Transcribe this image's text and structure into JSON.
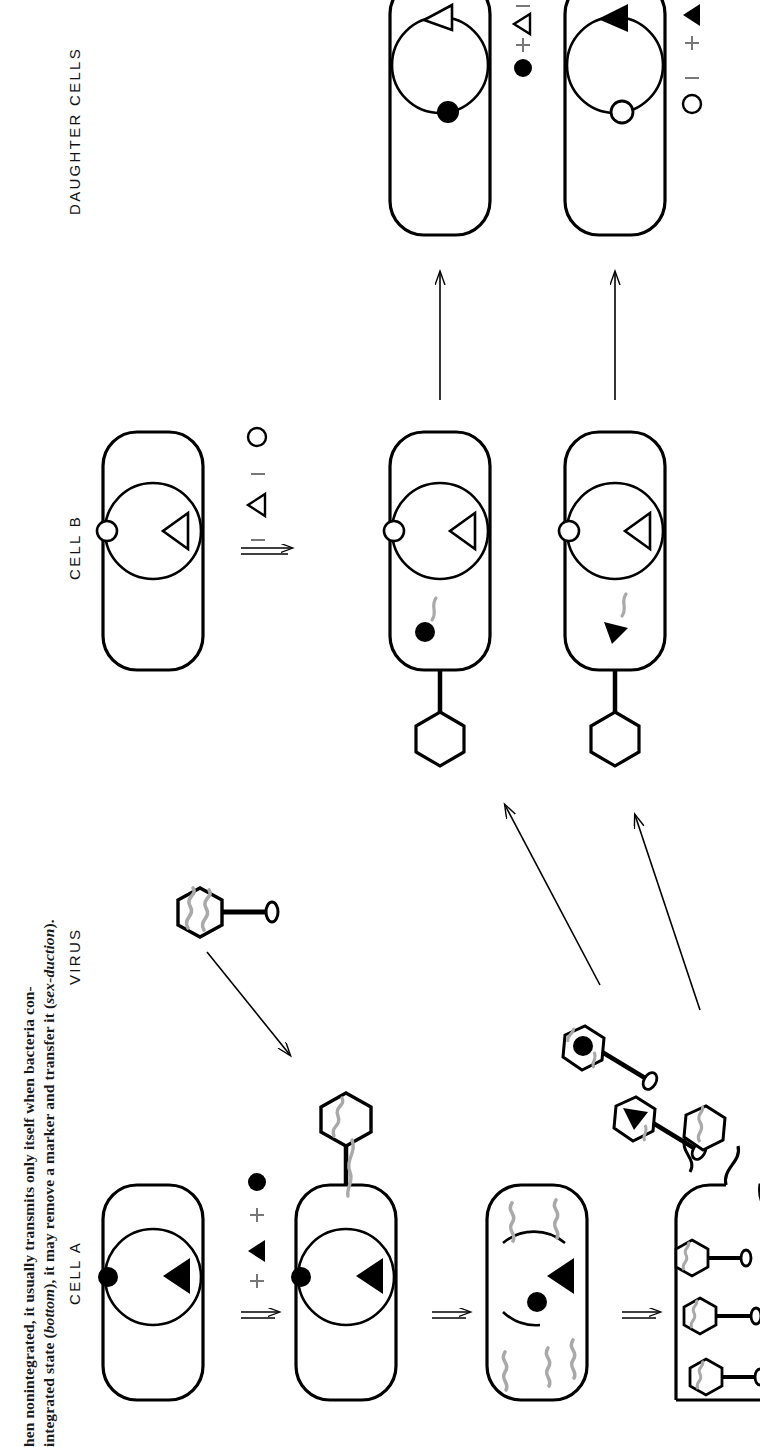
{
  "figure": {
    "orientation": "rotated-90-ccw",
    "caption": {
      "line1_prefix": "hen nonintegrated, it usually transmits only itself when bacteria con-",
      "line2_prefix": "integrated state (",
      "line2_italic1": "bottom",
      "line2_mid": "), it may remove a marker and transfer it (",
      "line2_italic2": "sex-duction",
      "line2_suffix": ")."
    },
    "columns": [
      {
        "id": "cell-a",
        "label": "CELL  A"
      },
      {
        "id": "virus",
        "label": "VIRUS"
      },
      {
        "id": "cell-b",
        "label": "CELL  B"
      },
      {
        "id": "daughter-cells",
        "label": "DAUGHTER  CELLS"
      }
    ],
    "legends": {
      "cell_a": [
        {
          "sign": "+",
          "glyph": "filled-triangle"
        },
        {
          "sign": "+",
          "glyph": "filled-circle"
        }
      ],
      "cell_b": [
        {
          "sign": "–",
          "glyph": "open-triangle"
        },
        {
          "sign": "–",
          "glyph": "open-circle"
        }
      ],
      "daughter_1": [
        {
          "sign": "–",
          "glyph": "open-triangle"
        },
        {
          "sign": "+",
          "glyph": "filled-circle"
        }
      ],
      "daughter_2": [
        {
          "sign": "+",
          "glyph": "filled-triangle"
        },
        {
          "sign": "–",
          "glyph": "open-circle"
        }
      ]
    },
    "cells": {
      "cell_a_stage1": {
        "name": "cell-a-intact",
        "chromosome_marker": "filled-triangle",
        "episome_marker": "filled-circle"
      },
      "cell_a_stage2": {
        "name": "cell-a-infected",
        "chromosome_marker": "filled-triangle",
        "episome_marker": "filled-circle",
        "has_virus_attached": true
      },
      "cell_a_stage3": {
        "name": "cell-a-replicating",
        "chromosome_marker": "filled-triangle",
        "episome_marker": "filled-circle",
        "dna_fragments": 5
      },
      "cell_a_stage4": {
        "name": "cell-a-lysing",
        "virus_particles": 5
      },
      "cell_b_stage1": {
        "name": "cell-b-intact",
        "chromosome_marker": "open-triangle",
        "episome_marker": "open-circle"
      },
      "cell_b_stage2": {
        "name": "cell-b-infected-marker",
        "chromosome_marker": "open-triangle",
        "episome_marker": "open-circle",
        "transduced_marker": "filled-circle",
        "has_virus_attached": true
      },
      "cell_b_stage3": {
        "name": "cell-b-infected-triangle",
        "chromosome_marker": "open-triangle",
        "episome_marker": "open-circle",
        "transduced_marker": "filled-triangle",
        "has_virus_attached": true
      },
      "daughter_1": {
        "name": "daughter-cell-1",
        "chromosome_marker": "open-triangle",
        "episome_marker": "filled-circle"
      },
      "daughter_2": {
        "name": "daughter-cell-2",
        "chromosome_marker": "filled-triangle",
        "episome_marker": "open-circle"
      }
    },
    "colors": {
      "ink": "#000000",
      "dna_gray": "#a9a9a9",
      "sign_gray": "#777777",
      "background": "#ffffff"
    }
  }
}
